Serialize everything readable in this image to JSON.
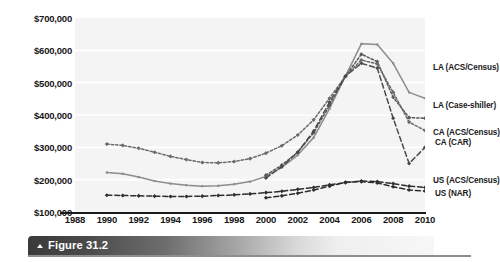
{
  "figure": {
    "caption_label": "Figure 31.2",
    "caption_marker": "triangle-up-icon"
  },
  "chart_data": {
    "type": "line",
    "title": "",
    "xlabel": "",
    "ylabel": "",
    "xlim": [
      1988,
      2010
    ],
    "ylim": [
      100000,
      700000
    ],
    "grid": true,
    "legend_position": "right-inline-end-labels",
    "y_ticks": [
      100000,
      200000,
      300000,
      400000,
      500000,
      600000,
      700000
    ],
    "y_tick_labels": [
      "$100,000",
      "$200,000",
      "$300,000",
      "$400,000",
      "$500,000",
      "$600,000",
      "$700,000"
    ],
    "x_ticks": [
      1988,
      1990,
      1992,
      1994,
      1996,
      1998,
      2000,
      2002,
      2004,
      2006,
      2008,
      2010
    ],
    "x_tick_labels": [
      "1988",
      "1990",
      "1992",
      "1994",
      "1996",
      "1998",
      "2000",
      "2002",
      "2004",
      "2006",
      "2008",
      "2010"
    ],
    "series": [
      {
        "name": "LA (ACS/Census)",
        "style": "solid",
        "color": "#8d8d8d",
        "marker": "none",
        "x": [
          1990,
          1991,
          1992,
          1993,
          1994,
          1995,
          1996,
          1997,
          1998,
          1999,
          2000,
          2001,
          2002,
          2003,
          2004,
          2005,
          2006,
          2007,
          2008,
          2009,
          2010
        ],
        "y": [
          222000,
          218000,
          208000,
          196000,
          188000,
          183000,
          180000,
          181000,
          186000,
          194000,
          210000,
          238000,
          276000,
          330000,
          420000,
          520000,
          620000,
          618000,
          560000,
          470000,
          452000
        ]
      },
      {
        "name": "LA (Case-shiller)",
        "style": "dotted",
        "color": "#5a5a5a",
        "marker": "diamond",
        "x": [
          2000,
          2001,
          2002,
          2003,
          2004,
          2005,
          2006,
          2007,
          2008,
          2009,
          2010
        ],
        "y": [
          214000,
          245000,
          285000,
          345000,
          430000,
          520000,
          588000,
          565000,
          455000,
          392000,
          390000
        ]
      },
      {
        "name": "CA (ACS/Census)",
        "style": "dotted",
        "color": "#6a6a6a",
        "marker": "diamond",
        "x": [
          1990,
          1991,
          1992,
          1993,
          1994,
          1995,
          1996,
          1997,
          1998,
          1999,
          2000,
          2001,
          2002,
          2003,
          2004,
          2005,
          2006,
          2007,
          2008,
          2009,
          2010
        ],
        "y": [
          310000,
          306000,
          297000,
          285000,
          272000,
          262000,
          253000,
          252000,
          256000,
          265000,
          282000,
          305000,
          338000,
          385000,
          452000,
          520000,
          570000,
          558000,
          470000,
          378000,
          352000
        ]
      },
      {
        "name": "CA (CAR)",
        "style": "dashed",
        "color": "#4a4a4a",
        "marker": "diamond",
        "x": [
          2000,
          2001,
          2002,
          2003,
          2004,
          2005,
          2006,
          2007,
          2008,
          2009,
          2010
        ],
        "y": [
          205000,
          240000,
          285000,
          350000,
          440000,
          520000,
          560000,
          545000,
          390000,
          250000,
          300000
        ]
      },
      {
        "name": "US (ACS/Census)",
        "style": "dashed",
        "color": "#2e2e2e",
        "marker": "diamond",
        "x": [
          1990,
          1991,
          1992,
          1993,
          1994,
          1995,
          1996,
          1997,
          1998,
          1999,
          2000,
          2001,
          2002,
          2003,
          2004,
          2005,
          2006,
          2007,
          2008,
          2009,
          2010
        ],
        "y": [
          152000,
          151000,
          150000,
          149000,
          148000,
          148000,
          149000,
          151000,
          153000,
          156000,
          160000,
          164000,
          170000,
          176000,
          184000,
          191000,
          196000,
          194000,
          188000,
          180000,
          176000
        ]
      },
      {
        "name": "US (NAR)",
        "style": "dashed",
        "color": "#2e2e2e",
        "marker": "diamond",
        "x": [
          2000,
          2001,
          2002,
          2003,
          2004,
          2005,
          2006,
          2007,
          2008,
          2009,
          2010
        ],
        "y": [
          144000,
          150000,
          158000,
          168000,
          180000,
          192000,
          194000,
          190000,
          178000,
          168000,
          165000
        ]
      }
    ],
    "series_end_labels": [
      {
        "name": "LA (ACS/Census)",
        "text": "LA (ACS/Census)"
      },
      {
        "name": "LA (Case-shiller)",
        "text": "LA (Case-shiller)"
      },
      {
        "name": "CA (ACS/Census)",
        "text": "CA (ACS/Census)"
      },
      {
        "name": "CA (CAR)",
        "text": "CA (CAR)"
      },
      {
        "name": "US (ACS/Census)",
        "text": "US (ACS/Census)"
      },
      {
        "name": "US (NAR)",
        "text": "US (NAR)"
      }
    ]
  }
}
